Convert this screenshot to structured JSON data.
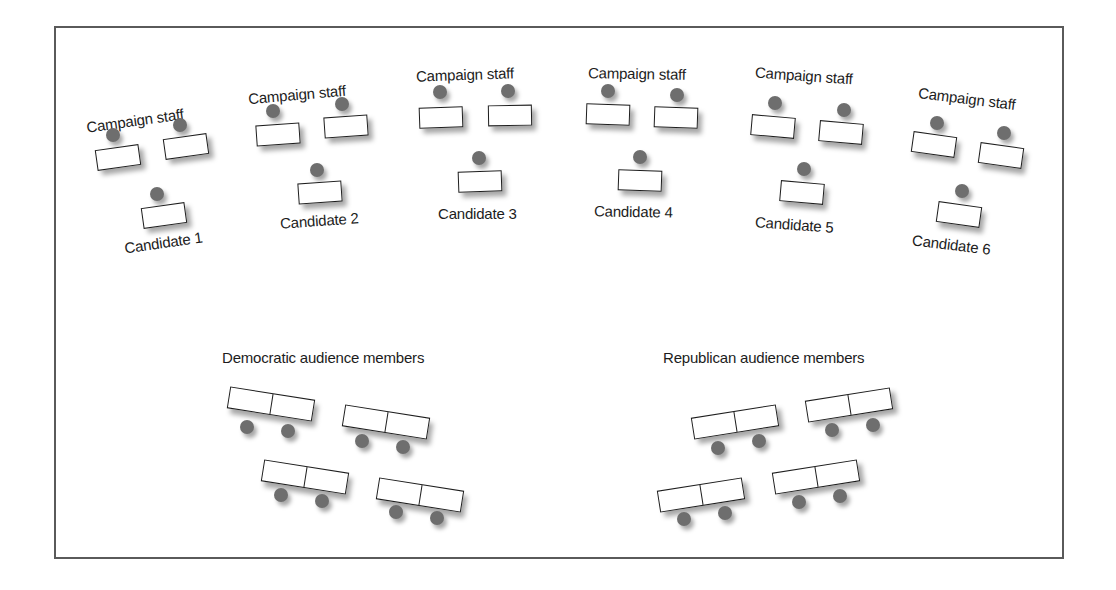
{
  "diagram": {
    "groups": [
      {
        "staff_label": "Campaign staff",
        "candidate_label": "Candidate 1"
      },
      {
        "staff_label": "Campaign staff",
        "candidate_label": "Candidate 2"
      },
      {
        "staff_label": "Campaign staff",
        "candidate_label": "Candidate 3"
      },
      {
        "staff_label": "Campaign staff",
        "candidate_label": "Candidate 4"
      },
      {
        "staff_label": "Campaign staff",
        "candidate_label": "Candidate 5"
      },
      {
        "staff_label": "Campaign staff",
        "candidate_label": "Candidate 6"
      }
    ],
    "audience": {
      "democratic_label": "Democratic audience members",
      "republican_label": "Republican audience members",
      "democratic_rows": 4,
      "republican_rows": 4,
      "seats_per_row": 2
    },
    "colors": {
      "border": "#5a5a5a",
      "desk_outline": "#1e1e1e",
      "head": "#6e6e6e",
      "text": "#1c1c1c"
    }
  }
}
